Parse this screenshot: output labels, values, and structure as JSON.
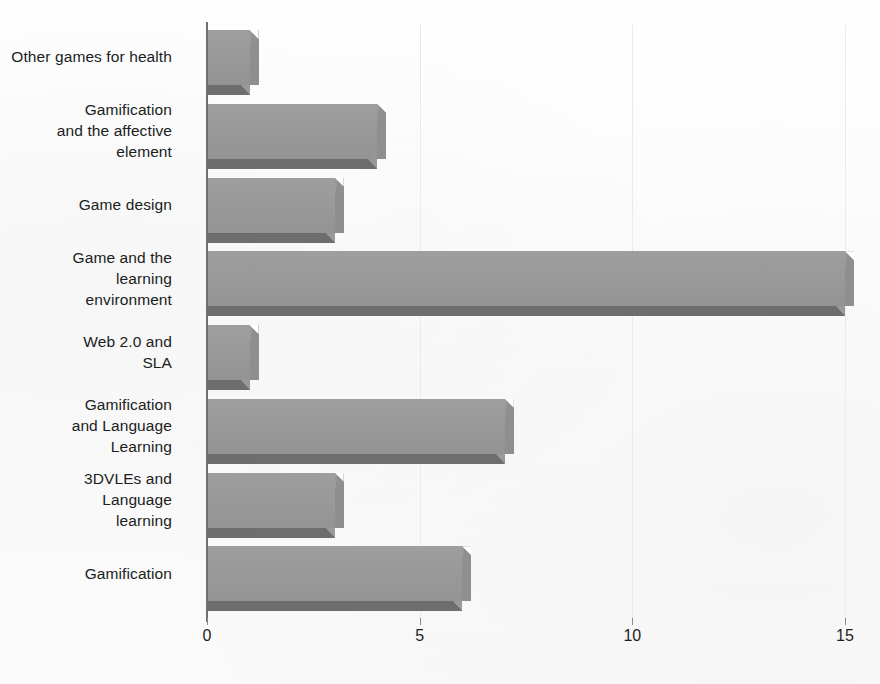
{
  "chart_data": {
    "type": "bar",
    "orientation": "horizontal",
    "title": "",
    "subtitle": "",
    "xlabel": "",
    "ylabel": "",
    "categories": [
      "Other games for health",
      "Gamification and the affective element",
      "Game design",
      "Game and the learning environment",
      "Web 2.0 and SLA",
      "Gamification and Language Learning",
      "3DVLEs and Language learning",
      "Gamification"
    ],
    "values": [
      1,
      4,
      3,
      15,
      1,
      7,
      3,
      6
    ],
    "xlim": [
      0,
      15
    ],
    "xticks": [
      0,
      5,
      10,
      15
    ],
    "xtick_labels": [
      "0",
      "5",
      "10",
      "15"
    ],
    "grid": true,
    "grid_axis": "x",
    "legend": false,
    "legend_position": "none",
    "bar_color": "#9a9a9a",
    "bar_shadow_color": "#6e6e6e",
    "gridline_color": "#ececec",
    "axis_color": "#6f6f6f",
    "text_color": "#201d1d",
    "background": "#fdfdfd"
  },
  "category_labels": [
    {
      "lines": [
        "Other games for health"
      ]
    },
    {
      "lines": [
        "Gamification",
        "and the affective",
        "element"
      ]
    },
    {
      "lines": [
        "Game design"
      ]
    },
    {
      "lines": [
        "Game and the",
        "learning",
        "environment"
      ]
    },
    {
      "lines": [
        "Web 2.0 and",
        "SLA"
      ]
    },
    {
      "lines": [
        "Gamification",
        "and Language",
        "Learning"
      ]
    },
    {
      "lines": [
        "3DVLEs and",
        "Language",
        "learning"
      ]
    },
    {
      "lines": [
        "Gamification"
      ]
    }
  ]
}
